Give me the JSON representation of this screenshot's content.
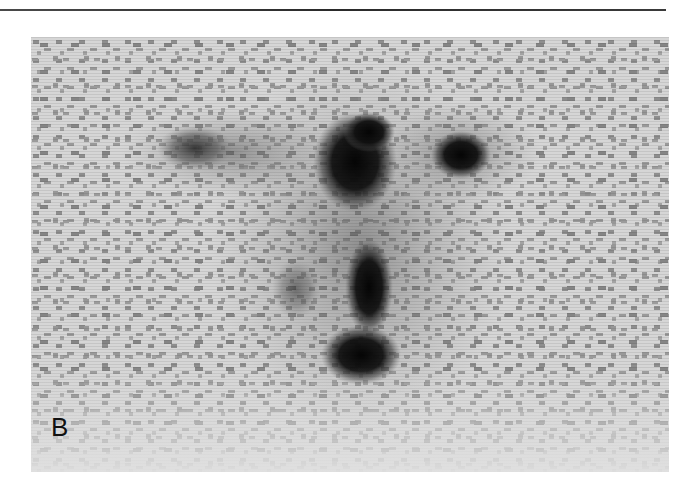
{
  "figure": {
    "panel_label": "B",
    "colors": {
      "background": "#d6d6d6",
      "speckle": "#8c8c8c",
      "hot_spot": "#0a0a0a",
      "rule": "#333333"
    },
    "hot_spots": [
      {
        "name": "left-focus",
        "cx": 164,
        "cy": 111,
        "rx": 38,
        "ry": 22,
        "intensity": 0.55
      },
      {
        "name": "upper-central-focus",
        "cx": 324,
        "cy": 125,
        "rx": 42,
        "ry": 50,
        "intensity": 1.0
      },
      {
        "name": "right-focus",
        "cx": 430,
        "cy": 118,
        "rx": 30,
        "ry": 24,
        "intensity": 0.95
      },
      {
        "name": "central-column-focus",
        "cx": 338,
        "cy": 250,
        "rx": 24,
        "ry": 48,
        "intensity": 0.95
      },
      {
        "name": "lower-central-focus",
        "cx": 330,
        "cy": 318,
        "rx": 40,
        "ry": 30,
        "intensity": 1.0
      },
      {
        "name": "faint-left-smudge",
        "cx": 265,
        "cy": 252,
        "rx": 24,
        "ry": 30,
        "intensity": 0.4
      }
    ]
  }
}
